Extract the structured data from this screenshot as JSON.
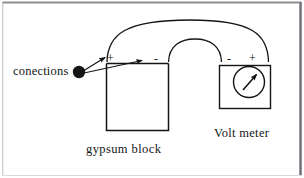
{
  "page": {
    "background_color": "#ffffff",
    "border_color": "#6f6f75",
    "ink_color": "#141414"
  },
  "labels": {
    "connections": "conections",
    "gypsum_block": "gypsum block",
    "volt_meter": "Volt meter"
  },
  "gypsum_block": {
    "terminal_left": "+",
    "terminal_right": "-"
  },
  "volt_meter": {
    "terminal_left": "-",
    "terminal_right": "+",
    "gauge": "needle-gauge"
  },
  "icons": {
    "connection_dot": "filled-circle-node",
    "arrow_to_plus": "arrow-icon",
    "arrow_to_minus": "arrow-icon",
    "gauge_needle": "needle-icon"
  }
}
